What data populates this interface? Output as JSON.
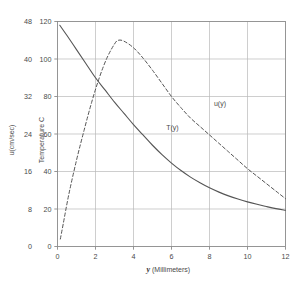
{
  "chart_data": {
    "type": "line",
    "title": "",
    "xlabel": "y (Millimeters)",
    "xlabel_var": "y",
    "xlabel_unit": "(Millimeters)",
    "ylabel_left_outer": "u(cm/sec)",
    "ylabel_left_inner": "Temperature C",
    "xlim": [
      0,
      12
    ],
    "ylim_outer": [
      0,
      48
    ],
    "ylim_inner": [
      0,
      120
    ],
    "xticks": [
      0,
      2,
      4,
      6,
      8,
      10,
      12
    ],
    "xtick_labels": [
      "0",
      "2",
      "4",
      "6",
      "8",
      "10",
      "12"
    ],
    "yticks_outer": [
      0,
      8,
      16,
      24,
      32,
      40,
      48
    ],
    "ytick_labels_outer": [
      "0",
      "8",
      "16",
      "24",
      "32",
      "40",
      "48"
    ],
    "yticks_inner": [
      0,
      20,
      40,
      60,
      80,
      100,
      120
    ],
    "ytick_labels_inner": [
      "0",
      "20",
      "40",
      "60",
      "80",
      "100",
      "120"
    ],
    "grid": true,
    "legend_position": "inline-annotations",
    "line_color": "#555555",
    "grid_color": "#b9b9b9",
    "frame_color": "#8a8a8a",
    "series": [
      {
        "name": "T(y)",
        "label": "T(y)",
        "style": "solid",
        "axis": "inner",
        "annotation_x": 6.05,
        "annotation_y": 62,
        "x": [
          0.12,
          0.5,
          1.0,
          1.5,
          2.0,
          2.5,
          3.0,
          3.5,
          4.0,
          4.5,
          5.0,
          5.5,
          6.0,
          6.5,
          7.0,
          7.5,
          8.0,
          8.5,
          9.0,
          9.5,
          10.0,
          10.5,
          11.0,
          11.5,
          12.0
        ],
        "y": [
          118.0,
          112.5,
          105.0,
          97.5,
          90.0,
          83.5,
          77.0,
          71.0,
          65.0,
          59.5,
          54.0,
          49.0,
          44.5,
          40.5,
          37.0,
          34.0,
          31.3,
          29.0,
          27.0,
          25.3,
          23.8,
          22.5,
          21.3,
          20.2,
          19.3
        ]
      },
      {
        "name": "u(y)",
        "label": "u(y)",
        "style": "dashed",
        "axis": "inner",
        "annotation_x": 8.55,
        "annotation_y": 75,
        "x": [
          0.15,
          0.3,
          0.6,
          1.0,
          1.4,
          1.8,
          2.2,
          2.6,
          3.0,
          3.2,
          3.5,
          4.0,
          4.5,
          5.0,
          5.5,
          6.0,
          6.5,
          7.0,
          7.5,
          8.0,
          8.5,
          9.0,
          9.5,
          10.0,
          10.5,
          11.0,
          11.5,
          12.0
        ],
        "y": [
          4.0,
          12.0,
          28.0,
          46.0,
          62.0,
          77.0,
          90.0,
          100.5,
          108.0,
          110.0,
          109.5,
          106.0,
          100.5,
          94.0,
          87.0,
          80.0,
          74.0,
          68.5,
          64.0,
          59.5,
          55.0,
          50.5,
          46.0,
          41.5,
          37.5,
          33.5,
          29.5,
          25.5
        ]
      }
    ]
  },
  "axes": {
    "outer_y_title": "u(cm/sec)",
    "inner_y_title": "Temperature C"
  }
}
